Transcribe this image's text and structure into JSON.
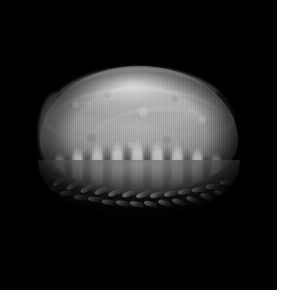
{
  "image": {
    "caption": "Grayscale photograph of a woven dome-shaped object on a black background",
    "subject_name": "woven dome object",
    "subject_description": "Wide flattened oval dome, like a coiled basket or beret, photographed from a low three-quarter angle",
    "orientation": "low three-quarter view, light from upper left",
    "color_mode": "grayscale",
    "width_px": 285,
    "height_px": 298
  },
  "canvas": {
    "background_color": "#ffffff",
    "plate_color": "#000000",
    "plate_width_px": 277,
    "plate_height_px": 290,
    "margin_right_px": 8,
    "margin_bottom_px": 8
  },
  "subject": {
    "bounds": {
      "left_px": 38,
      "top_px": 66,
      "width_px": 202,
      "height_px": 152
    },
    "parts": [
      {
        "name": "dome-body",
        "label": "Dome body",
        "description": "Flattened oval cap with mottled woven texture"
      },
      {
        "name": "rim-highlight",
        "label": "Top rim highlight",
        "description": "Bright specular arc along the upper left edge"
      },
      {
        "name": "pleat-band",
        "label": "Gathered pleats",
        "description": "Vertical finger-like ridges on the lower dome"
      },
      {
        "name": "braided-rim",
        "label": "Braided rim",
        "description": "Chevron plaited border encircling the base"
      }
    ]
  },
  "tones": {
    "background": "#000000",
    "highlight": "#e2e2e2",
    "midtone": "#9a9a9a",
    "shadow": "#3a3a3a",
    "deep_shadow": "#0a0a0a"
  },
  "pleats": {
    "light": [
      {
        "left_px": 6,
        "height_px": 38
      },
      {
        "left_px": 24,
        "height_px": 44
      },
      {
        "left_px": 44,
        "height_px": 48
      },
      {
        "left_px": 64,
        "height_px": 50
      },
      {
        "left_px": 84,
        "height_px": 52
      },
      {
        "left_px": 104,
        "height_px": 50
      },
      {
        "left_px": 124,
        "height_px": 48
      },
      {
        "left_px": 144,
        "height_px": 44
      },
      {
        "left_px": 163,
        "height_px": 38
      }
    ],
    "dark": [
      {
        "left_px": 16,
        "height_px": 36
      },
      {
        "left_px": 35,
        "height_px": 42
      },
      {
        "left_px": 55,
        "height_px": 46
      },
      {
        "left_px": 75,
        "height_px": 48
      },
      {
        "left_px": 95,
        "height_px": 48
      },
      {
        "left_px": 115,
        "height_px": 46
      },
      {
        "left_px": 135,
        "height_px": 42
      },
      {
        "left_px": 154,
        "height_px": 36
      }
    ]
  },
  "braid": {
    "strand_count": 26,
    "rows": [
      {
        "top_px": 14,
        "start_px": 14,
        "step_px": 14,
        "count": 13,
        "rotate_deg": -16
      },
      {
        "top_px": 24,
        "start_px": 8,
        "step_px": 14,
        "count": 13,
        "rotate_deg": 14
      }
    ]
  }
}
